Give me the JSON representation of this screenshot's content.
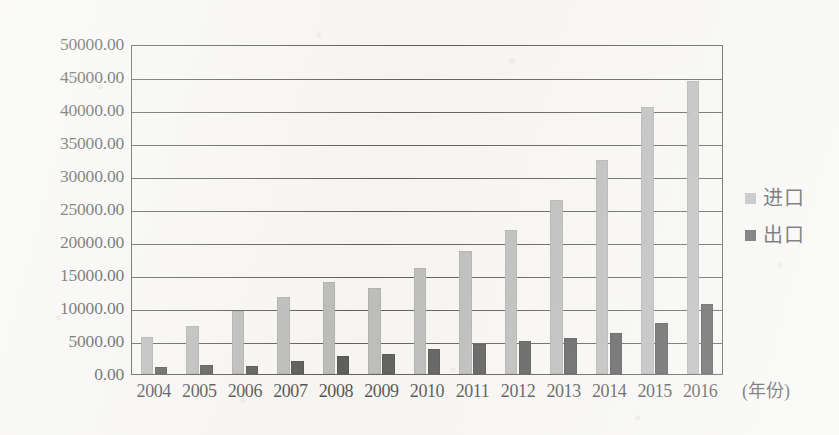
{
  "chart_data": {
    "type": "bar",
    "title": "",
    "xlabel": "(年份)",
    "ylabel": "",
    "categories": [
      "2004",
      "2005",
      "2006",
      "2007",
      "2008",
      "2009",
      "2010",
      "2011",
      "2012",
      "2013",
      "2014",
      "2015",
      "2016"
    ],
    "series": [
      {
        "name": "进口",
        "color": "#a9a9a9",
        "values": [
          5600,
          7300,
          9500,
          11700,
          14000,
          13100,
          16100,
          18700,
          21800,
          26400,
          32500,
          40500,
          44400
        ]
      },
      {
        "name": "出口",
        "color": "#2c2c2c",
        "values": [
          1100,
          1300,
          1200,
          2000,
          2700,
          3000,
          3800,
          4600,
          5000,
          5500,
          6200,
          7700,
          10600
        ]
      }
    ],
    "ylim": [
      0,
      50000
    ],
    "ytick_step": 5000,
    "ytick_labels": [
      "50000.00",
      "45000.00",
      "40000.00",
      "35000.00",
      "30000.00",
      "25000.00",
      "20000.00",
      "15000.00",
      "10000.00",
      "5000.00",
      "0.00"
    ],
    "ytick_values": [
      50000,
      45000,
      40000,
      35000,
      30000,
      25000,
      20000,
      15000,
      10000,
      5000,
      0
    ],
    "grid": true,
    "legend_position": "right",
    "legend": [
      {
        "label": "进口",
        "color": "#a9a9a9"
      },
      {
        "label": "出口",
        "color": "#2c2c2c"
      }
    ]
  }
}
